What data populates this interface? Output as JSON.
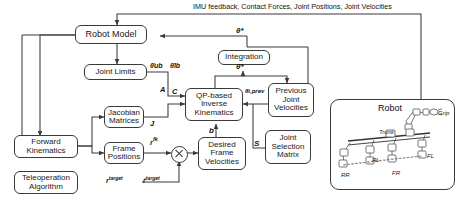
{
  "diagram": {
    "feedback_text": "IMU feedback, Contact Forces, Joint Positions, Joint Velocities",
    "blocks": [
      {
        "id": "robot_model",
        "label": "Robot Model"
      },
      {
        "id": "joint_limits",
        "label": "Joint Limits"
      },
      {
        "id": "jacobian",
        "label": "Jacobian\nMatrices"
      },
      {
        "id": "frame_positions",
        "label": "Frame\nPositions"
      },
      {
        "id": "forward_kin",
        "label": "Forward\nKinematics"
      },
      {
        "id": "teleop",
        "label": "Teleoperation\nAlgorithm"
      },
      {
        "id": "integration",
        "label": "Integration"
      },
      {
        "id": "qp_ik",
        "label": "QP-based\nInverse\nKinematics"
      },
      {
        "id": "desired_frame_vel",
        "label": "Desired\nFrame\nVelocities"
      },
      {
        "id": "prev_joint_vel",
        "label": "Previous\nJoint\nVelocities"
      },
      {
        "id": "joint_sel_matrix",
        "label": "Joint\nSelection\nMatrix"
      }
    ],
    "block_labels": {
      "robot_model": "Robot Model",
      "joint_limits": "Joint Limits",
      "jacobian_l1": "Jacobian",
      "jacobian_l2": "Matrices",
      "frame_pos_l1": "Frame",
      "frame_pos_l2": "Positions",
      "forward_kin_l1": "Forward",
      "forward_kin_l2": "Kinematics",
      "teleop_l1": "Teleoperation",
      "teleop_l2": "Algorithm",
      "integration": "Integration",
      "qp_l1": "QP-based",
      "qp_l2": "Inverse",
      "qp_l3": "Kinematics",
      "dfv_l1": "Desired",
      "dfv_l2": "Frame",
      "dfv_l3": "Velocities",
      "pjv_l1": "Previous",
      "pjv_l2": "Joint",
      "pjv_l3": "Velocities",
      "jsm_l1": "Joint",
      "jsm_l2": "Selection",
      "jsm_l3": "Matrix"
    },
    "signal_labels": {
      "theta_star_top": "θ*",
      "theta_dot_star": "θ̇*",
      "theta_dot_ub": "θ̇ub",
      "theta_dot_lb": "θ̇lb",
      "matrix_A": "A",
      "matrix_C": "C",
      "jacobian_J": "J",
      "frame_r_fk": "r",
      "frame_r_fk_sup": "fk",
      "vector_b": "b",
      "theta_dot_prev": "θ̇i,prev",
      "matrix_S": "S",
      "r_target": "r",
      "r_target_sup": "target",
      "rdot_target": "ṙ",
      "rdot_target_sup": "target"
    },
    "robot_panel": {
      "title": "Robot",
      "grip": "Grip",
      "trunk": "Trunk",
      "rl": "RL",
      "fl": "FL",
      "rr": "RR",
      "fr": "FR"
    },
    "colors": {
      "line": "#3a3a3a",
      "text": "#1a1a1a",
      "background": "#ffffff"
    }
  }
}
